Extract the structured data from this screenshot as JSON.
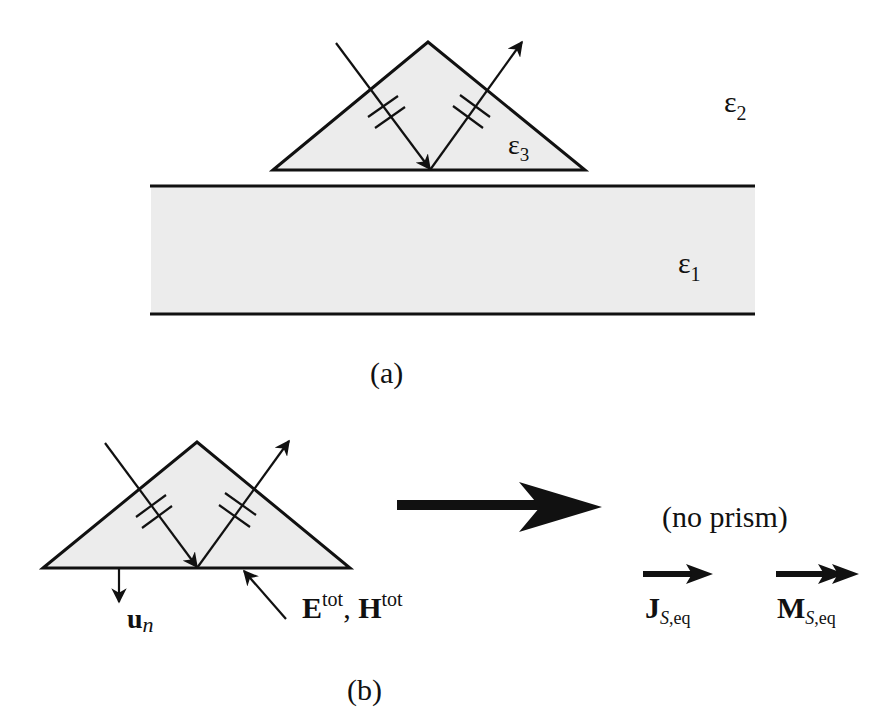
{
  "figure": {
    "panel_a": {
      "caption": "(a)",
      "regions": {
        "upper_medium": {
          "symbol": "ε",
          "subscript": "2"
        },
        "slab": {
          "symbol": "ε",
          "subscript": "1"
        },
        "prism": {
          "symbol": "ε",
          "subscript": "3"
        }
      }
    },
    "panel_b": {
      "caption": "(b)",
      "normal_vector": {
        "base": "u",
        "subscript": "n"
      },
      "fields": {
        "e_base": "E",
        "e_sup": "tot",
        "separator": ", ",
        "h_base": "H",
        "h_sup": "tot"
      },
      "equivalence_note": "(no prism)",
      "currents": {
        "electric": {
          "base": "J",
          "sub_italic": "S",
          "sub_rest": ",eq"
        },
        "magnetic": {
          "base": "M",
          "sub_italic": "S",
          "sub_rest": ",eq"
        }
      }
    },
    "colors": {
      "stroke": "#111111",
      "fill": "#ececec",
      "background": "#ffffff"
    }
  }
}
